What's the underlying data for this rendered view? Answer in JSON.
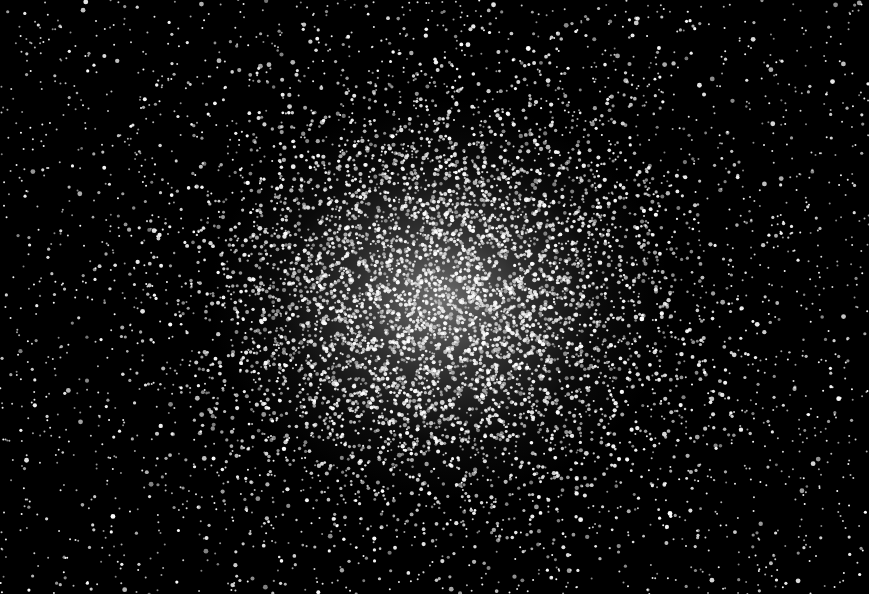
{
  "image": {
    "subject": "globular star cluster",
    "width": 869,
    "height": 594,
    "colors": {
      "background": "#000000",
      "star": "#ffffff",
      "core_glow": "#c8c8c8"
    },
    "cluster": {
      "center_x": 440,
      "center_y": 300,
      "radius_x": 230,
      "radius_y": 200
    },
    "star_field": {
      "background_star_count": 2600,
      "cluster_star_count": 5200,
      "seed": 42
    }
  }
}
